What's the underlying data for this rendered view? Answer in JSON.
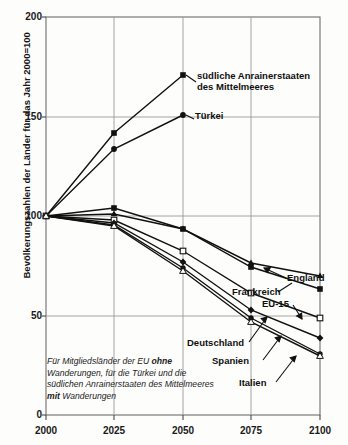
{
  "chart_data": {
    "type": "line",
    "title": "",
    "subtitle": "",
    "xlabel": "",
    "ylabel": "Bevölkerungszahlen der Länder für das Jahr 2000=100",
    "x": [
      2000,
      2025,
      2050,
      2075,
      2100
    ],
    "xlim": [
      2000,
      2100
    ],
    "ylim": [
      0,
      200
    ],
    "yticks": [
      0,
      50,
      100,
      150,
      200
    ],
    "xticks": [
      2000,
      2025,
      2050,
      2075,
      2100
    ],
    "grid": true,
    "legend_position": "inline-annotations",
    "annotation": "Für Mitgliedsländer der EU ohne Wanderungen, für die Türkei und die südlichen Anrainerstaaten des Mittelmeeres mit Wanderungen",
    "annotation_parts": [
      {
        "text": "Für Mitgliedsländer der EU ",
        "bold": false
      },
      {
        "text": "ohne",
        "bold": true
      },
      {
        "text": " Wanderungen, für die Türkei und die südlichen Anrainerstaaten des Mittelmeeres ",
        "bold": false
      },
      {
        "text": "mit",
        "bold": true
      },
      {
        "text": " Wanderungen",
        "bold": false
      }
    ],
    "series": [
      {
        "name": "südliche Anrainerstaaten des Mittelmeeres",
        "marker": "square-filled",
        "values": [
          100,
          142,
          163,
          null,
          null
        ]
      },
      {
        "name": "Türkei",
        "marker": "circle-filled",
        "values": [
          100,
          134,
          151,
          null,
          null
        ]
      },
      {
        "name": "England",
        "marker": "triangle-filled",
        "values": [
          100,
          101,
          94,
          77,
          70
        ]
      },
      {
        "name": "Frankreich",
        "marker": "square-filled",
        "values": [
          100,
          102,
          94,
          75,
          64
        ]
      },
      {
        "name": "EU-15",
        "marker": "square-open",
        "values": [
          100,
          98,
          83,
          62,
          49
        ]
      },
      {
        "name": "Deutschland",
        "marker": "diamond-filled",
        "values": [
          100,
          97,
          77,
          53,
          39
        ]
      },
      {
        "name": "Spanien",
        "marker": "circle-filled",
        "values": [
          100,
          96,
          74,
          49,
          31
        ]
      },
      {
        "name": "Italien",
        "marker": "triangle-open",
        "values": [
          100,
          96,
          74,
          47,
          30
        ]
      }
    ]
  },
  "axis": {
    "y_tick_labels": [
      "200",
      "150",
      "100",
      "50",
      "0"
    ],
    "x_tick_labels": [
      "2000",
      "2025",
      "2050",
      "2075",
      "2100"
    ],
    "y_axis_title": "Bevölkerungszahlen der Länder für das Jahr 2000=100"
  },
  "labels": {
    "med_line1": "südliche Anrainerstaaten",
    "med_line2": "des Mittelmeeres",
    "turkey": "Türkei",
    "england": "England",
    "france": "Frankreich",
    "eu15": "EU-15",
    "germany": "Deutschland",
    "spain": "Spanien",
    "italy": "Italien"
  },
  "colors": {
    "line": "#111111",
    "grid": "#9a9a9a",
    "axis": "#4a4a4a",
    "background": "#fdfdfc",
    "text": "#111111"
  }
}
